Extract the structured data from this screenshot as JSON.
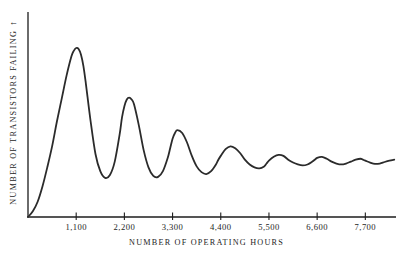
{
  "chart_data": {
    "type": "line",
    "title": "",
    "subtitle": "",
    "xlabel": "NUMBER OF OPERATING HOURS",
    "ylabel": "NUMBER OF TRANSISTORS FAILING",
    "ylabel_arrow": "↑",
    "grid": false,
    "legend": null,
    "legend_position": "none",
    "axis_color": "#1d1d1d",
    "line_color": "#2b2b2b",
    "line_width_px": 1.8,
    "xlim": [
      0,
      8400
    ],
    "ylim": [
      0,
      1.0
    ],
    "yticks": [],
    "ytick_labels": [],
    "xticks": [
      1100,
      2200,
      3300,
      4400,
      5500,
      6600,
      7700
    ],
    "xtick_labels": [
      "1,100",
      "2,200",
      "3,300",
      "4,400",
      "5,500",
      "6,600",
      "7,700"
    ],
    "series": [
      {
        "name": "transistors failing",
        "x": [
          0,
          110,
          220,
          330,
          440,
          550,
          660,
          770,
          880,
          990,
          1045,
          1100,
          1155,
          1210,
          1265,
          1320,
          1430,
          1540,
          1650,
          1760,
          1870,
          1980,
          2090,
          2145,
          2200,
          2255,
          2310,
          2365,
          2420,
          2530,
          2640,
          2750,
          2860,
          2970,
          3080,
          3190,
          3245,
          3300,
          3355,
          3410,
          3520,
          3630,
          3740,
          3850,
          3960,
          4070,
          4180,
          4290,
          4345,
          4400,
          4510,
          4620,
          4730,
          4840,
          4950,
          5060,
          5170,
          5280,
          5390,
          5445,
          5500,
          5610,
          5720,
          5830,
          5940,
          6050,
          6160,
          6270,
          6380,
          6490,
          6545,
          6600,
          6710,
          6820,
          6930,
          7040,
          7150,
          7260,
          7370,
          7480,
          7590,
          7645,
          7700,
          7810,
          7920,
          8030,
          8140,
          8250,
          8360
        ],
        "y": [
          0.0,
          0.03,
          0.08,
          0.16,
          0.26,
          0.37,
          0.5,
          0.62,
          0.74,
          0.84,
          0.87,
          0.885,
          0.88,
          0.85,
          0.79,
          0.7,
          0.5,
          0.33,
          0.24,
          0.205,
          0.22,
          0.29,
          0.43,
          0.52,
          0.58,
          0.615,
          0.625,
          0.615,
          0.59,
          0.48,
          0.35,
          0.26,
          0.215,
          0.21,
          0.24,
          0.31,
          0.36,
          0.41,
          0.44,
          0.455,
          0.44,
          0.39,
          0.32,
          0.265,
          0.235,
          0.225,
          0.24,
          0.275,
          0.3,
          0.32,
          0.355,
          0.37,
          0.36,
          0.335,
          0.3,
          0.275,
          0.26,
          0.255,
          0.265,
          0.28,
          0.295,
          0.315,
          0.325,
          0.32,
          0.3,
          0.285,
          0.275,
          0.27,
          0.275,
          0.29,
          0.3,
          0.31,
          0.315,
          0.305,
          0.29,
          0.28,
          0.275,
          0.28,
          0.29,
          0.3,
          0.305,
          0.3,
          0.295,
          0.285,
          0.278,
          0.28,
          0.288,
          0.295,
          0.3
        ]
      }
    ],
    "annotations": []
  },
  "axes": {
    "xlabel": "NUMBER OF OPERATING HOURS",
    "ylabel": "NUMBER OF TRANSISTORS FAILING",
    "ylabel_arrow": "↑",
    "xtick_labels": [
      "1,100",
      "2,200",
      "3,300",
      "4,400",
      "5,500",
      "6,600",
      "7,700"
    ]
  }
}
